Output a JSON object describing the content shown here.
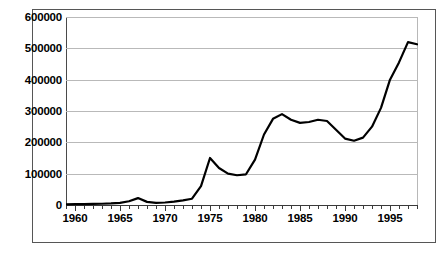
{
  "chart_data": {
    "type": "line",
    "title": "",
    "subtitle": "",
    "xlabel": "",
    "ylabel": "",
    "xlim": [
      1959,
      1998
    ],
    "ylim": [
      0,
      600000
    ],
    "grid": true,
    "legend": null,
    "y_ticks": [
      0,
      100000,
      200000,
      300000,
      400000,
      500000,
      600000
    ],
    "y_tick_labels": [
      "0",
      "100000",
      "200000",
      "300000",
      "400000",
      "500000",
      "600000"
    ],
    "x_ticks": [
      1960,
      1965,
      1970,
      1975,
      1980,
      1985,
      1990,
      1995
    ],
    "x_tick_labels": [
      "1960",
      "1965",
      "1970",
      "1975",
      "1980",
      "1985",
      "1990",
      "1995"
    ],
    "x_minor_tick_step": 1,
    "line_color": "#000000",
    "line_width": 2.2,
    "x": [
      1959,
      1960,
      1961,
      1962,
      1963,
      1964,
      1965,
      1966,
      1967,
      1968,
      1969,
      1970,
      1971,
      1972,
      1973,
      1974,
      1975,
      1976,
      1977,
      1978,
      1979,
      1980,
      1981,
      1982,
      1983,
      1984,
      1985,
      1986,
      1987,
      1988,
      1989,
      1990,
      1991,
      1992,
      1993,
      1994,
      1995,
      1996,
      1997,
      1998
    ],
    "values": [
      2000,
      2500,
      3000,
      3500,
      4000,
      5000,
      7000,
      12000,
      22000,
      10000,
      7000,
      8000,
      11000,
      15000,
      20000,
      60000,
      150000,
      118000,
      100000,
      95000,
      98000,
      145000,
      225000,
      275000,
      290000,
      272000,
      262000,
      265000,
      272000,
      268000,
      240000,
      212000,
      205000,
      215000,
      250000,
      310000,
      400000,
      455000,
      520000,
      513000
    ],
    "series": [
      {
        "name": "series-1",
        "values": [
          2000,
          2500,
          3000,
          3500,
          4000,
          5000,
          7000,
          12000,
          22000,
          10000,
          7000,
          8000,
          11000,
          15000,
          20000,
          60000,
          150000,
          118000,
          100000,
          95000,
          98000,
          145000,
          225000,
          275000,
          290000,
          272000,
          262000,
          265000,
          272000,
          268000,
          240000,
          212000,
          205000,
          215000,
          250000,
          310000,
          400000,
          455000,
          520000,
          513000
        ]
      }
    ]
  }
}
